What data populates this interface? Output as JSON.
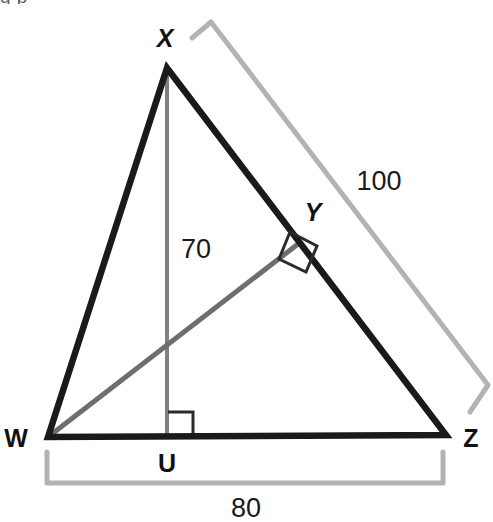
{
  "figure": {
    "canvas": {
      "width": 493,
      "height": 522
    },
    "background_color": "#ffffff",
    "clipped_top_text": "g  p",
    "colors": {
      "triangle_stroke": "#1a1a1a",
      "altitude_xu_stroke": "#808080",
      "altitude_wy_stroke": "#6e6e6e",
      "right_angle_stroke": "#4a4a4a",
      "dimension_bracket": "#b3b3b3",
      "label_text": "#111111",
      "measure_text": "#1a1a1a"
    },
    "vertices": [
      {
        "name": "X",
        "label": "X",
        "x": 167,
        "y": 68,
        "label_x": 165,
        "label_y": 38,
        "italic": true
      },
      {
        "name": "W",
        "label": "W",
        "x": 48,
        "y": 437,
        "label_x": 16,
        "label_y": 438,
        "italic": false
      },
      {
        "name": "Z",
        "label": "Z",
        "x": 446,
        "y": 435,
        "label_x": 471,
        "label_y": 438,
        "italic": false
      },
      {
        "name": "Y",
        "label": "Y",
        "x": 297,
        "y": 245,
        "label_x": 313,
        "label_y": 212,
        "italic": true
      },
      {
        "name": "U",
        "label": "U",
        "x": 167,
        "y": 437,
        "label_x": 167,
        "label_y": 463,
        "italic": false
      }
    ],
    "segments": [
      {
        "name": "side-WX",
        "from": "W",
        "to": "X",
        "style": "thick-black"
      },
      {
        "name": "side-XZ",
        "from": "X",
        "to": "Z",
        "style": "thick-black"
      },
      {
        "name": "side-WZ",
        "from": "W",
        "to": "Z",
        "style": "thick-black"
      },
      {
        "name": "altitude-XU",
        "from": "X",
        "to": "U",
        "style": "gray-thin"
      },
      {
        "name": "altitude-WY",
        "from": "W",
        "to": "Y",
        "style": "gray-medium"
      }
    ],
    "right_angles": [
      {
        "name": "right-angle-at-U",
        "at": "U"
      },
      {
        "name": "right-angle-at-Y",
        "at": "Y"
      }
    ],
    "measurements": [
      {
        "name": "measure-xz",
        "value": "100",
        "label_x": 379,
        "label_y": 181,
        "describes": "XZ"
      },
      {
        "name": "measure-xu",
        "value": "70",
        "label_x": 196,
        "label_y": 249,
        "describes": "XU"
      },
      {
        "name": "measure-wz",
        "value": "80",
        "label_x": 246,
        "label_y": 508,
        "describes": "WZ"
      }
    ],
    "dimension_brackets": [
      {
        "name": "bracket-100",
        "for": "XZ",
        "orientation": "diagonal"
      },
      {
        "name": "bracket-80",
        "for": "WZ",
        "orientation": "horizontal"
      }
    ]
  }
}
